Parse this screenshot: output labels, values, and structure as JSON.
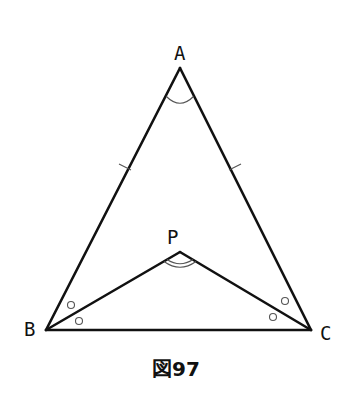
{
  "figure": {
    "caption": "図97",
    "vertices": {
      "A": {
        "label": "A",
        "x": 180,
        "y": 68
      },
      "B": {
        "label": "B",
        "x": 46,
        "y": 330
      },
      "C": {
        "label": "C",
        "x": 311,
        "y": 330
      },
      "P": {
        "label": "P",
        "x": 180,
        "y": 252
      }
    },
    "segments": [
      {
        "from": "A",
        "to": "B",
        "tick_marks": 1
      },
      {
        "from": "A",
        "to": "C",
        "tick_marks": 1
      },
      {
        "from": "B",
        "to": "C",
        "tick_marks": 0
      },
      {
        "from": "P",
        "to": "B",
        "tick_marks": 0
      },
      {
        "from": "P",
        "to": "C",
        "tick_marks": 0
      }
    ],
    "angle_marks": [
      {
        "at": "A",
        "style": "single-arc",
        "between": [
          "B",
          "C"
        ]
      },
      {
        "at": "P",
        "style": "double-arc",
        "between": [
          "B",
          "C"
        ]
      },
      {
        "at": "B",
        "style": "circle",
        "between": [
          "A",
          "P"
        ]
      },
      {
        "at": "B",
        "style": "circle",
        "between": [
          "P",
          "C"
        ]
      },
      {
        "at": "C",
        "style": "circle",
        "between": [
          "A",
          "P"
        ]
      },
      {
        "at": "C",
        "style": "circle",
        "between": [
          "P",
          "B"
        ]
      }
    ],
    "colors": {
      "line": "#111111",
      "marks": "#555555",
      "background": "#ffffff"
    }
  }
}
